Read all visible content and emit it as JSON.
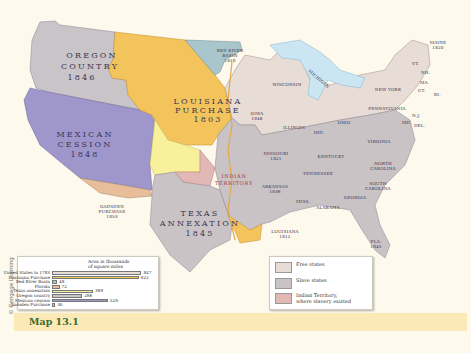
{
  "caption": "Map 13.1",
  "credit": "© Cengage Learning",
  "colors": {
    "free_states": "#e8dcd6",
    "slave_states": "#c9c3c6",
    "indian_territory": "#e2b8b5",
    "oregon": "#c8c4c8",
    "louisiana": "#f3c45c",
    "mexican_cession": "#9f97cc",
    "texas": "#c9c3c6",
    "red_river": "#a9c6cc",
    "gadsden": "#e8bd9a",
    "unorganized": "#f8f19b",
    "water": "#cbe6f2",
    "background": "#fdf9ec",
    "caption_bg": "#fbe9b7",
    "caption_text": "#3b6b2f"
  },
  "regions": {
    "oregon": {
      "name": "OREGON",
      "name2": "COUNTRY",
      "year": "1846"
    },
    "louisiana": {
      "name": "LOUISIANA",
      "name2": "PURCHASE",
      "year": "1803"
    },
    "mexican": {
      "name": "MEXICAN",
      "name2": "CESSION",
      "year": "1848"
    },
    "texas": {
      "name": "TEXAS",
      "name2": "ANNEXATION",
      "year": "1845"
    },
    "red_river": {
      "name": "RED RIVER",
      "name2": "BASIN",
      "year": "1818"
    },
    "gadsden": {
      "name": "GADSDEN",
      "name2": "PURCHASE",
      "year": "1853"
    },
    "indian": {
      "name": "INDIAN",
      "name2": "TERRITORY"
    }
  },
  "states": {
    "maine": {
      "name": "MAINE",
      "year": "1820"
    },
    "vt": "VT.",
    "nh": "NH.",
    "ma": "MA.",
    "ct": "CT.",
    "ri": "RI.",
    "new_york": "NEW YORK",
    "pennsylvania": "PENNSYLVANIA",
    "nj": "N.J.",
    "del": "DEL.",
    "md": "MD.",
    "michigan": "MICHIGAN",
    "wisconsin": "WISCONSIN",
    "iowa": {
      "name": "IOWA",
      "year": "1846"
    },
    "illinois": "ILLINOIS",
    "ind": "IND.",
    "ohio": "OHIO",
    "virginia": "VIRGINIA",
    "kentucky": "KENTUCKY",
    "missouri": {
      "name": "MISSOURI",
      "year": "1821"
    },
    "tennessee": "TENNESSEE",
    "north_carolina": {
      "name": "NORTH",
      "name2": "CAROLINA"
    },
    "south_carolina": {
      "name": "SOUTH",
      "name2": "CAROLINA"
    },
    "arkansas": {
      "name": "ARKANSAS",
      "year": "1836"
    },
    "miss": "MISS.",
    "alabama": "ALABAMA",
    "georgia": "GEORGIA",
    "louisiana_state": {
      "name": "LOUISIANA",
      "year": "1812"
    },
    "fla": {
      "name": "FLA.",
      "year": "1845"
    }
  },
  "chart_data": {
    "type": "bar",
    "title": "Area in thousands of square miles",
    "title_line1": "Area in thousands",
    "title_line2": "of square miles",
    "categories": [
      "United States in 1783",
      "Louisiana Purchase",
      "Red River Basin",
      "Florida",
      "Texas annexation",
      "Oregon country",
      "Mexican cession",
      "Gadsden Purchase"
    ],
    "values": [
      847,
      822,
      48,
      72,
      389,
      286,
      529,
      30
    ],
    "value_labels": [
      "847",
      "822",
      "48",
      "72",
      "389",
      "286",
      "529",
      "30"
    ],
    "bar_colors": [
      "#e8dcd6",
      "#f3c45c",
      "#a9c6cc",
      "#e8bd9a",
      "#f8f19b",
      "#c9c3c6",
      "#9f97cc",
      "#e8bd9a"
    ],
    "xlim": [
      0,
      900
    ],
    "grid": false,
    "legend": "none"
  },
  "legend": {
    "items": [
      {
        "label": "Free states",
        "color": "#e8dcd6"
      },
      {
        "label": "Slave states",
        "color": "#c9c3c6"
      },
      {
        "label": "Indian Territory,",
        "label2": "where slavery existed",
        "color": "#e2b8b5"
      }
    ]
  }
}
